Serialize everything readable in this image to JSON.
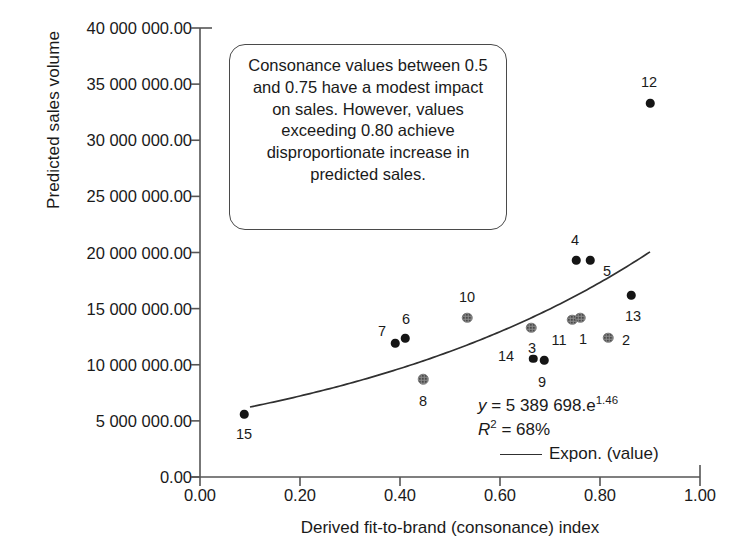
{
  "chart_data": {
    "type": "scatter",
    "title": "",
    "xlabel": "Derived fit-to-brand (consonance) index",
    "ylabel": "Predicted sales volume",
    "xlim": [
      0.0,
      1.0
    ],
    "ylim": [
      0.0,
      40000000.0
    ],
    "xticks": [
      "0.00",
      "0.20",
      "0.40",
      "0.60",
      "0.80",
      "1.00"
    ],
    "xtick_values": [
      0.0,
      0.2,
      0.4,
      0.6,
      0.8,
      1.0
    ],
    "yticks": [
      "0.00",
      "5 000 000.00",
      "10 000 000.00",
      "15 000 000.00",
      "20 000 000.00",
      "25 000 000.00",
      "30 000 000.00",
      "35 000 000.00",
      "40 000 000.00"
    ],
    "ytick_values": [
      0,
      5000000,
      10000000,
      15000000,
      20000000,
      25000000,
      30000000,
      35000000,
      40000000
    ],
    "grid": false,
    "legend_position": "inside-lower-right",
    "points": [
      {
        "label": "15",
        "x": 0.088,
        "y": 5600000,
        "style": "solid",
        "label_dx": 0,
        "label_dy": 20
      },
      {
        "label": "7",
        "x": 0.39,
        "y": 11900000,
        "style": "solid",
        "label_dx": -13,
        "label_dy": -12
      },
      {
        "label": "6",
        "x": 0.41,
        "y": 12350000,
        "style": "solid",
        "label_dx": 1,
        "label_dy": -19
      },
      {
        "label": "8",
        "x": 0.446,
        "y": 8700000,
        "style": "hatch",
        "label_dx": 0,
        "label_dy": 22
      },
      {
        "label": "10",
        "x": 0.534,
        "y": 14200000,
        "style": "hatch",
        "label_dx": 0,
        "label_dy": -21
      },
      {
        "label": "3",
        "x": 0.662,
        "y": 13300000,
        "style": "hatch",
        "label_dx": 1,
        "label_dy": 20
      },
      {
        "label": "14",
        "x": 0.666,
        "y": 10550000,
        "style": "solid",
        "label_dx": -27,
        "label_dy": -3
      },
      {
        "label": "9",
        "x": 0.688,
        "y": 10400000,
        "style": "solid",
        "label_dx": -2,
        "label_dy": 22
      },
      {
        "label": "11",
        "x": 0.744,
        "y": 14000000,
        "style": "hatch",
        "label_dx": -13,
        "label_dy": 20
      },
      {
        "label": "1",
        "x": 0.76,
        "y": 14200000,
        "style": "hatch",
        "label_dx": 3,
        "label_dy": 21
      },
      {
        "label": "4",
        "x": 0.752,
        "y": 19300000,
        "style": "solid",
        "label_dx": -1,
        "label_dy": -20
      },
      {
        "label": "5",
        "x": 0.78,
        "y": 19300000,
        "style": "solid",
        "label_dx": 17,
        "label_dy": 11
      },
      {
        "label": "2",
        "x": 0.816,
        "y": 12400000,
        "style": "hatch",
        "label_dx": 18,
        "label_dy": 2
      },
      {
        "label": "13",
        "x": 0.862,
        "y": 16200000,
        "style": "solid",
        "label_dx": 2,
        "label_dy": 21
      },
      {
        "label": "12",
        "x": 0.9,
        "y": 33300000,
        "style": "solid",
        "label_dx": -1,
        "label_dy": -21
      }
    ],
    "trendline": {
      "type": "exponential",
      "coefficient": 5389698,
      "exponent": 1.46,
      "x_start": 0.1,
      "x_end": 0.9,
      "equation_text": "y = 5 389 698.e",
      "equation_exponent": "1.46",
      "r_squared_label": "R",
      "r_squared_sup": "2",
      "r_squared_value": "= 68%",
      "legend_label": "Expon. (value)"
    }
  },
  "annotation": {
    "text": "Consonance values between 0.5 and 0.75 have a modest impact on sales. However, values exceeding 0.80 achieve disproportionate increase in predicted sales."
  }
}
